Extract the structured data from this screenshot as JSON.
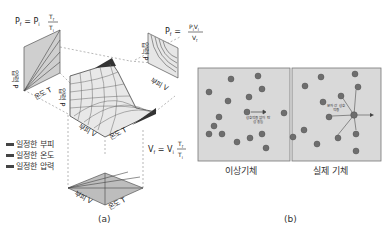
{
  "panel_a": {
    "caption": "(a)",
    "equations": {
      "isothermal_top_left": "P_f = P_i T_f / T_i",
      "isothermal_top_left_lhs": "P",
      "top_right": "P_f = P_i V_i / V_f",
      "bottom_right": "V_f = V_i T_f / T_i"
    },
    "axis_labels": {
      "pressure": "압력 P",
      "volume": "부피 V",
      "temperature": "온도 T"
    },
    "legend": [
      {
        "label": "일정한 부피",
        "color": "#444444"
      },
      {
        "label": "일정한 온도",
        "color": "#444444"
      },
      {
        "label": "일정한 압력",
        "color": "#444444"
      }
    ]
  },
  "panel_b": {
    "caption": "(b)",
    "ideal_gas": {
      "title": "이상기체",
      "annotation": "상호작용 없이 탄성 충돌"
    },
    "real_gas": {
      "title": "실제 기체",
      "annotation": "분자 간 상호작용"
    },
    "colors": {
      "box_bg": "#d9d9d9",
      "molecule": "#6e6e6e"
    }
  }
}
